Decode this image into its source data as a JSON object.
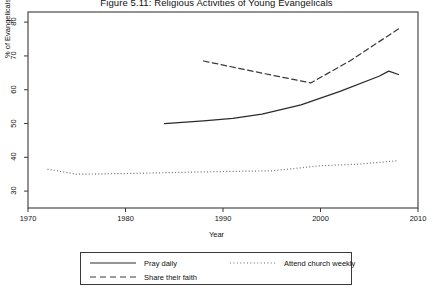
{
  "chart_data": {
    "type": "line",
    "title": "Figure 5.11: Religious Activities of Young Evangelicals",
    "xlabel": "Year",
    "ylabel": "% of Evangelicals",
    "xlim": [
      1970,
      2010
    ],
    "ylim": [
      25,
      83
    ],
    "xticks": [
      "1970",
      "1980",
      "1990",
      "2000",
      "2010"
    ],
    "xtick_values": [
      1970,
      1980,
      1990,
      2000,
      2010
    ],
    "yticks": [
      "30",
      "40",
      "50",
      "60",
      "70",
      "80"
    ],
    "ytick_values": [
      30,
      40,
      50,
      60,
      70,
      80
    ],
    "grid": false,
    "legend_position": "below-center",
    "series": [
      {
        "name": "Pray daily",
        "style": "solid",
        "color": "#2b2b2b",
        "x": [
          1984,
          1988,
          1991,
          1994,
          1998,
          2002,
          2006,
          2007,
          2008
        ],
        "values": [
          50.0,
          50.8,
          51.5,
          52.8,
          55.5,
          59.5,
          64.0,
          65.5,
          64.5
        ]
      },
      {
        "name": "Attend church weekly",
        "style": "dotted",
        "color": "#6e6e6e",
        "x": [
          1972,
          1975,
          1980,
          1985,
          1990,
          1995,
          2000,
          2004,
          2008
        ],
        "values": [
          36.5,
          35.0,
          35.2,
          35.5,
          35.8,
          36.0,
          37.5,
          38.0,
          39.0
        ]
      },
      {
        "name": "Share their faith",
        "style": "dashed",
        "color": "#3a3a3a",
        "x": [
          1988,
          1993,
          1999,
          2003,
          2008
        ],
        "values": [
          68.5,
          65.5,
          62.0,
          68.5,
          78.0
        ]
      }
    ]
  },
  "legend": {
    "items": [
      {
        "label": "Pray daily",
        "style": "solid"
      },
      {
        "label": "Share their faith",
        "style": "dashed"
      },
      {
        "label": "Attend church weekly",
        "style": "dotted"
      }
    ]
  }
}
